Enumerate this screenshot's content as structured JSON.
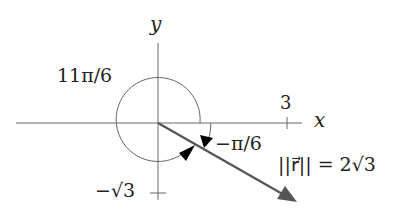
{
  "diagram": {
    "axes": {
      "x_label": "x",
      "y_label": "y",
      "x_tick_label": "3",
      "y_tick_label": "−√3"
    },
    "angles": {
      "reflex_angle_label": "11π/6",
      "negative_angle_label": "−π/6"
    },
    "vector": {
      "magnitude_label": "||r⃗|| = 2√3",
      "components": {
        "x": 3,
        "y": "-√3"
      }
    },
    "colors": {
      "axis": "#555555",
      "circle": "#666666",
      "vector": "#555555",
      "arrowhead": "#000000",
      "text": "#222222"
    }
  }
}
